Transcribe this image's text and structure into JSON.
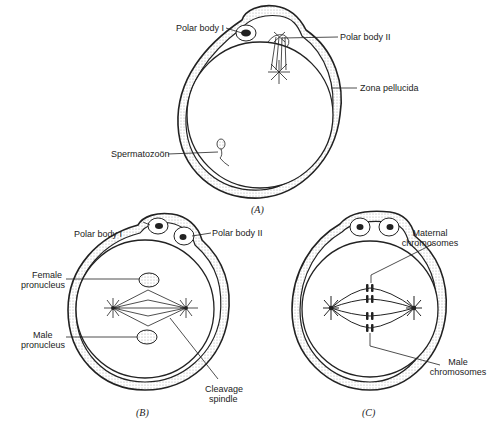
{
  "panels": {
    "A": {
      "caption": "(A)",
      "labels": {
        "polar_body_1": "Polar body I",
        "polar_body_2": "Polar body II",
        "zona_pellucida": "Zona pellucida",
        "spermatozoon": "Spermatozoön"
      }
    },
    "B": {
      "caption": "(B)",
      "labels": {
        "polar_body_1": "Polar body I",
        "polar_body_2": "Polar body II",
        "female_pronucleus_1": "Female",
        "female_pronucleus_2": "pronucleus",
        "male_pronucleus_1": "Male",
        "male_pronucleus_2": "pronucleus",
        "cleavage_spindle_1": "Cleavage",
        "cleavage_spindle_2": "spindle"
      }
    },
    "C": {
      "caption": "(C)",
      "labels": {
        "maternal_1": "Maternal",
        "maternal_2": "chromosomes",
        "male_1": "Male",
        "male_2": "chromosomes"
      }
    }
  },
  "colors": {
    "ink": "#222222",
    "stipple": "#bdbdbd",
    "background": "#ffffff"
  }
}
